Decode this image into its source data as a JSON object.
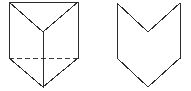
{
  "canvas": {
    "width": 191,
    "height": 91,
    "background_color": "#ffffff",
    "stroke_color": "#2b2b2b",
    "hidden_stroke_color": "#3a3a3a",
    "stroke_width": 1,
    "hidden_dash_pattern": "5 3"
  },
  "figures": [
    {
      "id": "figure-left",
      "name": "triangular-prism",
      "description": "Triangular prism drawn in oblique view with one hidden edge shown dashed",
      "fill_color": "#ffffff",
      "outline_points": "9,2 78,2 78,58 43,87 9,58",
      "visible_edges": [
        {
          "name": "top-edge",
          "points": "9,2 78,2"
        },
        {
          "name": "left-vertical-edge",
          "points": "9,2 9,58"
        },
        {
          "name": "right-vertical-edge",
          "points": "78,2 78,58"
        },
        {
          "name": "lower-left-slant-edge",
          "points": "9,58 43,87"
        },
        {
          "name": "lower-right-slant-edge",
          "points": "78,58 43,87"
        },
        {
          "name": "top-face-left-diagonal",
          "points": "9,2 43,32"
        },
        {
          "name": "top-face-right-diagonal",
          "points": "78,2 43,32"
        },
        {
          "name": "front-center-vertical-edge",
          "points": "43,32 43,87"
        }
      ],
      "hidden_edges": [
        {
          "name": "hidden-back-base-edge",
          "points": "9,58 78,58"
        }
      ]
    },
    {
      "id": "figure-right",
      "name": "chevron-notch-polygon",
      "description": "Closed polygon shaped like a downward chevron with a V notch cut into its top edge",
      "fill_color": "#ffffff",
      "outline_points": "117,3 117,58 148,87 180,58 180,3 148,32",
      "visible_edges": [
        {
          "name": "left-vertical-edge",
          "points": "117,3 117,58"
        },
        {
          "name": "lower-left-slant-edge",
          "points": "117,58 148,87"
        },
        {
          "name": "lower-right-slant-edge",
          "points": "148,87 180,58"
        },
        {
          "name": "right-vertical-edge",
          "points": "180,58 180,3"
        },
        {
          "name": "notch-right-slant-edge",
          "points": "180,3 148,32"
        },
        {
          "name": "notch-left-slant-edge",
          "points": "148,32 117,3"
        }
      ],
      "hidden_edges": []
    }
  ]
}
